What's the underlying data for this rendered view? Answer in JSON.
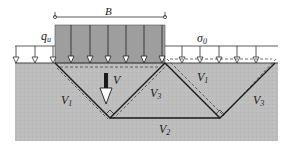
{
  "diagram": {
    "labels": {
      "width": "B",
      "ultimate_load": "q",
      "ultimate_load_sub": "u",
      "surcharge": "σ",
      "surcharge_sub": "0",
      "velocity": "V",
      "left_wedge_v1": "V",
      "left_wedge_v1_sub": "1",
      "center_wedge_v3": "V",
      "center_wedge_v3_sub": "3",
      "right_wedge_v1": "V",
      "right_wedge_v1_sub": "1",
      "right_wedge_v3": "V",
      "right_wedge_v3_sub": "3",
      "bottom_v2": "V",
      "bottom_v2_sub": "2"
    },
    "colors": {
      "soil": "#b9b9b9",
      "footing": "#9e9e9e",
      "lines": "#1a1a1a",
      "background": "#ffffff"
    }
  }
}
